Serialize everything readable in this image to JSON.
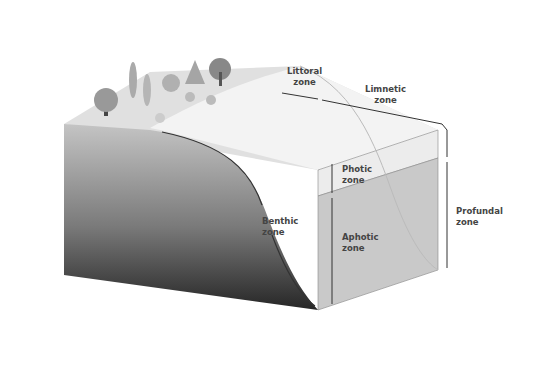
{
  "diagram": {
    "labels": {
      "littoral": "Littoral\nzone",
      "limnetic": "Limnetic\nzone",
      "photic": "Photic\nzone",
      "aphotic": "Aphotic\nzone",
      "benthic": "Benthic\nzone",
      "profundal": "Profundal\nzone"
    },
    "colors": {
      "land": "#e2e2e2",
      "shallow_water": "#f1f1f1",
      "photic_water": "#ececec",
      "aphotic_water": "#c9c9c9",
      "soil_top": "#bdbdbd",
      "soil_bottom": "#2a2a2a",
      "line": "#3a3a3a"
    }
  }
}
